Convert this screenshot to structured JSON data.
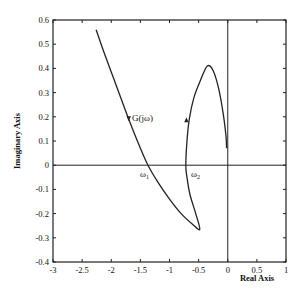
{
  "chart_data": {
    "type": "line",
    "title": "",
    "xlabel": "Real Axis",
    "ylabel": "Imaginary Axis",
    "xlim": [
      -3,
      1
    ],
    "ylim": [
      -0.4,
      0.6
    ],
    "x_ticks": [
      "-3",
      "-2.5",
      "-2",
      "-1.5",
      "-1",
      "-0.5",
      "0",
      "0.5",
      "1"
    ],
    "y_ticks": [
      "-0.4",
      "-0.3",
      "-0.2",
      "-0.1",
      "0",
      "0.1",
      "0.2",
      "0.3",
      "0.4",
      "0.5",
      "0.6"
    ],
    "grid": false,
    "reference_lines": {
      "x": 0,
      "y": 0
    },
    "series": [
      {
        "name": "G(jω)",
        "x": [
          -2.26,
          -2.1,
          -1.9,
          -1.7,
          -1.5,
          -1.37,
          -1.2,
          -1.0,
          -0.8,
          -0.6,
          -0.48,
          -0.55,
          -0.65,
          -0.7,
          -0.72,
          -0.7,
          -0.66,
          -0.58,
          -0.47,
          -0.35,
          -0.25,
          -0.15,
          -0.07,
          -0.03,
          -0.02
        ],
        "y": [
          0.56,
          0.45,
          0.32,
          0.19,
          0.07,
          0.0,
          -0.07,
          -0.14,
          -0.2,
          -0.245,
          -0.265,
          -0.2,
          -0.12,
          -0.05,
          0.0,
          0.1,
          0.19,
          0.28,
          0.35,
          0.41,
          0.39,
          0.31,
          0.2,
          0.12,
          0.07
        ]
      }
    ],
    "annotations": [
      {
        "text": "G(jω)",
        "x": -1.6,
        "y": 0.19
      },
      {
        "text": "ω1",
        "x": -1.45,
        "y": -0.04
      },
      {
        "text": "ω2",
        "x": -0.65,
        "y": -0.04
      }
    ],
    "arrows": [
      {
        "x": -1.7,
        "y": 0.19,
        "direction": "down"
      },
      {
        "x": -0.71,
        "y": 0.19,
        "direction": "up"
      }
    ]
  },
  "labels": {
    "xlabel": "Real Axis",
    "ylabel": "Imaginary Axis",
    "curve_label": "G(jω)",
    "omega1": "ω",
    "omega1_sub": "1",
    "omega2": "ω",
    "omega2_sub": "2"
  }
}
